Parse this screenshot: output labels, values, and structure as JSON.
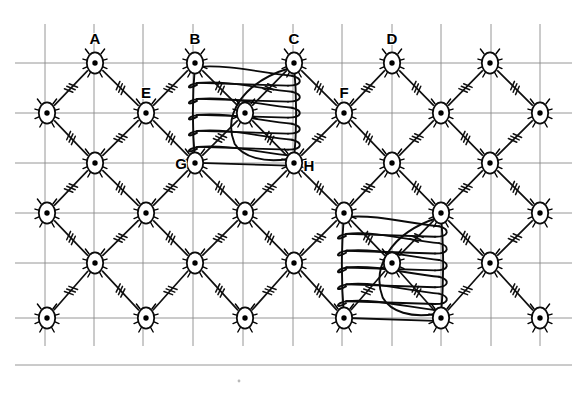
{
  "figure": {
    "canvas": {
      "width": 581,
      "height": 397,
      "background": "#ffffff"
    },
    "colors": {
      "grid": "#8a8a8a",
      "edge": "#101010",
      "node_stroke": "#0a0a0a",
      "node_fill": "#ffffff",
      "node_dot": "#000000",
      "coil": "#0b0b0b",
      "label": "#000000"
    },
    "grid": {
      "visible": true,
      "vertical_x": [
        45,
        94,
        143,
        193,
        243,
        293,
        342,
        392,
        441,
        491,
        540
      ],
      "horizontal_y": [
        63,
        113,
        163,
        213,
        263,
        318,
        365
      ],
      "v_top": 24,
      "v_bottom": 346,
      "h_left": 15,
      "h_right": 572
    },
    "nodes": [
      {
        "id": "n-r1-c1",
        "x": 95,
        "y": 63,
        "label": "A"
      },
      {
        "id": "n-r1-c2",
        "x": 195,
        "y": 63,
        "label": "B"
      },
      {
        "id": "n-r1-c3",
        "x": 294,
        "y": 63,
        "label": "C"
      },
      {
        "id": "n-r1-c4",
        "x": 392,
        "y": 63,
        "label": "D"
      },
      {
        "id": "n-r1-c5",
        "x": 490,
        "y": 63,
        "label": ""
      },
      {
        "id": "n-r2-c0",
        "x": 47,
        "y": 113,
        "label": ""
      },
      {
        "id": "n-r2-c1",
        "x": 146,
        "y": 113,
        "label": "E"
      },
      {
        "id": "n-r2-c2",
        "x": 245,
        "y": 113,
        "label": ""
      },
      {
        "id": "n-r2-c3",
        "x": 344,
        "y": 113,
        "label": "F"
      },
      {
        "id": "n-r2-c4",
        "x": 441,
        "y": 113,
        "label": ""
      },
      {
        "id": "n-r2-c5",
        "x": 540,
        "y": 113,
        "label": ""
      },
      {
        "id": "n-r3-c1",
        "x": 95,
        "y": 163,
        "label": ""
      },
      {
        "id": "n-r3-c2",
        "x": 195,
        "y": 163,
        "label": "G"
      },
      {
        "id": "n-r3-c3",
        "x": 294,
        "y": 163,
        "label": "H"
      },
      {
        "id": "n-r3-c4",
        "x": 392,
        "y": 163,
        "label": ""
      },
      {
        "id": "n-r3-c5",
        "x": 490,
        "y": 163,
        "label": ""
      },
      {
        "id": "n-r4-c0",
        "x": 47,
        "y": 213,
        "label": ""
      },
      {
        "id": "n-r4-c1",
        "x": 146,
        "y": 213,
        "label": ""
      },
      {
        "id": "n-r4-c2",
        "x": 245,
        "y": 213,
        "label": ""
      },
      {
        "id": "n-r4-c3",
        "x": 344,
        "y": 213,
        "label": ""
      },
      {
        "id": "n-r4-c4",
        "x": 441,
        "y": 213,
        "label": ""
      },
      {
        "id": "n-r4-c5",
        "x": 540,
        "y": 213,
        "label": ""
      },
      {
        "id": "n-r5-c1",
        "x": 95,
        "y": 263,
        "label": ""
      },
      {
        "id": "n-r5-c2",
        "x": 195,
        "y": 263,
        "label": ""
      },
      {
        "id": "n-r5-c3",
        "x": 294,
        "y": 263,
        "label": ""
      },
      {
        "id": "n-r5-c4",
        "x": 392,
        "y": 263,
        "label": ""
      },
      {
        "id": "n-r5-c5",
        "x": 490,
        "y": 263,
        "label": ""
      },
      {
        "id": "n-r6-c0",
        "x": 47,
        "y": 318,
        "label": ""
      },
      {
        "id": "n-r6-c1",
        "x": 146,
        "y": 318,
        "label": ""
      },
      {
        "id": "n-r6-c2",
        "x": 245,
        "y": 318,
        "label": ""
      },
      {
        "id": "n-r6-c3",
        "x": 344,
        "y": 318,
        "label": ""
      },
      {
        "id": "n-r6-c4",
        "x": 441,
        "y": 318,
        "label": ""
      },
      {
        "id": "n-r6-c5",
        "x": 540,
        "y": 318,
        "label": ""
      }
    ],
    "edges": [
      {
        "from": "n-r1-c1",
        "to": "n-r2-c0",
        "ticks": 3
      },
      {
        "from": "n-r1-c1",
        "to": "n-r2-c1",
        "ticks": 3
      },
      {
        "from": "n-r1-c2",
        "to": "n-r2-c1",
        "ticks": 3
      },
      {
        "from": "n-r1-c2",
        "to": "n-r2-c2",
        "ticks": 3
      },
      {
        "from": "n-r1-c3",
        "to": "n-r2-c2",
        "ticks": 3
      },
      {
        "from": "n-r1-c3",
        "to": "n-r2-c3",
        "ticks": 3
      },
      {
        "from": "n-r1-c4",
        "to": "n-r2-c3",
        "ticks": 3
      },
      {
        "from": "n-r1-c4",
        "to": "n-r2-c4",
        "ticks": 3
      },
      {
        "from": "n-r1-c5",
        "to": "n-r2-c4",
        "ticks": 3
      },
      {
        "from": "n-r1-c5",
        "to": "n-r2-c5",
        "ticks": 3
      },
      {
        "from": "n-r2-c0",
        "to": "n-r3-c1",
        "ticks": 3
      },
      {
        "from": "n-r2-c1",
        "to": "n-r3-c1",
        "ticks": 3
      },
      {
        "from": "n-r2-c1",
        "to": "n-r3-c2",
        "ticks": 3
      },
      {
        "from": "n-r2-c2",
        "to": "n-r3-c2",
        "ticks": 3
      },
      {
        "from": "n-r2-c2",
        "to": "n-r3-c3",
        "ticks": 3
      },
      {
        "from": "n-r2-c3",
        "to": "n-r3-c3",
        "ticks": 3
      },
      {
        "from": "n-r2-c3",
        "to": "n-r3-c4",
        "ticks": 3
      },
      {
        "from": "n-r2-c4",
        "to": "n-r3-c4",
        "ticks": 3
      },
      {
        "from": "n-r2-c4",
        "to": "n-r3-c5",
        "ticks": 3
      },
      {
        "from": "n-r2-c5",
        "to": "n-r3-c5",
        "ticks": 3
      },
      {
        "from": "n-r3-c1",
        "to": "n-r4-c0",
        "ticks": 3
      },
      {
        "from": "n-r3-c1",
        "to": "n-r4-c1",
        "ticks": 3
      },
      {
        "from": "n-r3-c2",
        "to": "n-r4-c1",
        "ticks": 3
      },
      {
        "from": "n-r3-c2",
        "to": "n-r4-c2",
        "ticks": 3
      },
      {
        "from": "n-r3-c3",
        "to": "n-r4-c2",
        "ticks": 3
      },
      {
        "from": "n-r3-c3",
        "to": "n-r4-c3",
        "ticks": 3
      },
      {
        "from": "n-r3-c4",
        "to": "n-r4-c3",
        "ticks": 3
      },
      {
        "from": "n-r3-c4",
        "to": "n-r4-c4",
        "ticks": 3
      },
      {
        "from": "n-r3-c5",
        "to": "n-r4-c4",
        "ticks": 3
      },
      {
        "from": "n-r3-c5",
        "to": "n-r4-c5",
        "ticks": 3
      },
      {
        "from": "n-r4-c0",
        "to": "n-r5-c1",
        "ticks": 3
      },
      {
        "from": "n-r4-c1",
        "to": "n-r5-c1",
        "ticks": 3
      },
      {
        "from": "n-r4-c1",
        "to": "n-r5-c2",
        "ticks": 3
      },
      {
        "from": "n-r4-c2",
        "to": "n-r5-c2",
        "ticks": 3
      },
      {
        "from": "n-r4-c2",
        "to": "n-r5-c3",
        "ticks": 3
      },
      {
        "from": "n-r4-c3",
        "to": "n-r5-c3",
        "ticks": 3
      },
      {
        "from": "n-r4-c3",
        "to": "n-r5-c4",
        "ticks": 3
      },
      {
        "from": "n-r4-c4",
        "to": "n-r5-c4",
        "ticks": 3
      },
      {
        "from": "n-r4-c4",
        "to": "n-r5-c5",
        "ticks": 3
      },
      {
        "from": "n-r4-c5",
        "to": "n-r5-c5",
        "ticks": 3
      },
      {
        "from": "n-r5-c1",
        "to": "n-r6-c0",
        "ticks": 3
      },
      {
        "from": "n-r5-c1",
        "to": "n-r6-c1",
        "ticks": 3
      },
      {
        "from": "n-r5-c2",
        "to": "n-r6-c1",
        "ticks": 3
      },
      {
        "from": "n-r5-c2",
        "to": "n-r6-c2",
        "ticks": 3
      },
      {
        "from": "n-r5-c3",
        "to": "n-r6-c2",
        "ticks": 3
      },
      {
        "from": "n-r5-c3",
        "to": "n-r6-c3",
        "ticks": 3
      },
      {
        "from": "n-r5-c4",
        "to": "n-r6-c3",
        "ticks": 3
      },
      {
        "from": "n-r5-c4",
        "to": "n-r6-c4",
        "ticks": 3
      },
      {
        "from": "n-r5-c5",
        "to": "n-r6-c4",
        "ticks": 3
      },
      {
        "from": "n-r5-c5",
        "to": "n-r6-c5",
        "ticks": 3
      }
    ],
    "coils": [
      {
        "id": "coil-upper",
        "name": "coil-spring-bcgh",
        "corners": {
          "tl": "n-r1-c2",
          "tr": "n-r1-c3",
          "bl": "n-r3-c2",
          "br": "n-r3-c3"
        },
        "x_left": 195,
        "x_right": 294,
        "y_top": 65,
        "y_bottom": 161,
        "turns": 6
      },
      {
        "id": "coil-lower",
        "name": "coil-spring-lower",
        "corners": {
          "tl": "n-r4-c3",
          "tr": "n-r4-c4",
          "bl": "n-r6-c3",
          "br": "n-r6-c4"
        },
        "x_left": 344,
        "x_right": 441,
        "y_top": 215,
        "y_bottom": 316,
        "turns": 6
      }
    ],
    "labels": [
      {
        "text": "A",
        "x": 95,
        "y": 44,
        "anchor": "middle"
      },
      {
        "text": "B",
        "x": 195,
        "y": 44,
        "anchor": "middle"
      },
      {
        "text": "C",
        "x": 294,
        "y": 44,
        "anchor": "middle"
      },
      {
        "text": "D",
        "x": 392,
        "y": 44,
        "anchor": "middle"
      },
      {
        "text": "E",
        "x": 146,
        "y": 98,
        "anchor": "middle"
      },
      {
        "text": "F",
        "x": 344,
        "y": 98,
        "anchor": "middle"
      },
      {
        "text": "G",
        "x": 181,
        "y": 169,
        "anchor": "middle"
      },
      {
        "text": "H",
        "x": 309,
        "y": 171,
        "anchor": "middle"
      }
    ]
  }
}
